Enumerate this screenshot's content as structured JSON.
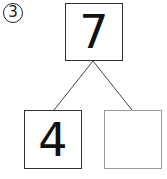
{
  "problem": {
    "number_label": "3"
  },
  "diagram": {
    "top": {
      "value": "7"
    },
    "left": {
      "value": "4"
    },
    "right": {
      "value": ""
    }
  }
}
